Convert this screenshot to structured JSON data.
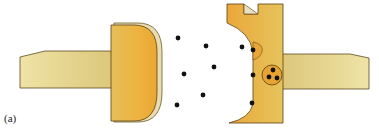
{
  "figure": {
    "panel_label": "(a)",
    "colors": {
      "handle": "#e2cf86",
      "handle_light": "#efe3a6",
      "head": "#e9b13f",
      "head_edge": "#f3d98a",
      "outline": "#4a3a1a",
      "shadow": "#d9cfae",
      "dot": "#111111"
    },
    "left_piece": {
      "name": "left-electrode"
    },
    "right_piece": {
      "name": "right-electrode",
      "cluster_dots": 3
    },
    "free_dots": [
      [
        178,
        38
      ],
      [
        206,
        46
      ],
      [
        242,
        47
      ],
      [
        214,
        67
      ],
      [
        184,
        74
      ],
      [
        203,
        95
      ],
      [
        177,
        105
      ]
    ],
    "surface_dots": [
      [
        253,
        50
      ],
      [
        253,
        75
      ],
      [
        252,
        104
      ]
    ]
  }
}
